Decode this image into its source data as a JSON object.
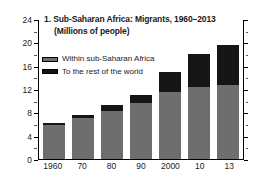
{
  "chart_data": {
    "type": "bar",
    "stacked": true,
    "title": "1. Sub-Saharan Africa: Migrants, 1960–2013",
    "subtitle": "(Millions of people)",
    "xlabel": "",
    "ylabel": "",
    "categories": [
      "1960",
      "70",
      "80",
      "90",
      "2000",
      "10",
      "13"
    ],
    "series": [
      {
        "name": "Within sub-Saharan Africa",
        "color": "#6e6e6e",
        "values": [
          5.8,
          7.0,
          8.3,
          9.6,
          11.5,
          12.3,
          12.7
        ]
      },
      {
        "name": "To the rest of the world",
        "color": "#151515",
        "values": [
          0.4,
          0.5,
          1.0,
          1.4,
          3.5,
          5.7,
          6.8
        ]
      }
    ],
    "totals": [
      6.2,
      7.5,
      9.3,
      11.0,
      15.0,
      18.0,
      19.5
    ],
    "ylim": [
      0,
      24
    ],
    "yticks": [
      0,
      4,
      8,
      12,
      16,
      20,
      24
    ],
    "yticks_minor": [
      2,
      6,
      10,
      14,
      18,
      22
    ],
    "ytick_labels": [
      "0",
      "4",
      "8",
      "12",
      "16",
      "20",
      "24"
    ],
    "grid": false,
    "legend_position": "top-left",
    "axes": [
      "left",
      "right",
      "bottom"
    ]
  },
  "legend": {
    "items": [
      {
        "label": "Within sub-Saharan Africa",
        "swatch": "gray-swatch"
      },
      {
        "label": "To the rest of the world",
        "swatch": "black-swatch"
      }
    ]
  },
  "colors": {
    "within_africa": "#6e6e6e",
    "rest_of_world": "#151515",
    "axis": "#000000",
    "background": "#ffffff"
  }
}
